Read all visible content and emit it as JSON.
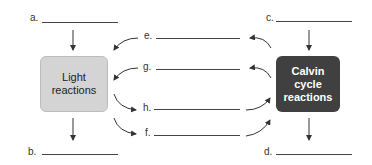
{
  "boxes": {
    "light": {
      "line1": "Light",
      "line2": "reactions"
    },
    "calvin": {
      "line1": "Calvin",
      "line2": "cycle",
      "line3": "reactions"
    }
  },
  "blanks": {
    "a": "a.",
    "b": "b.",
    "c": "c.",
    "d": "d.",
    "e": "e.",
    "f": "f.",
    "g": "g.",
    "h": "h."
  },
  "colors": {
    "light_box": "#d4d4d4",
    "calvin_box": "#404040",
    "arrow": "#333333"
  }
}
